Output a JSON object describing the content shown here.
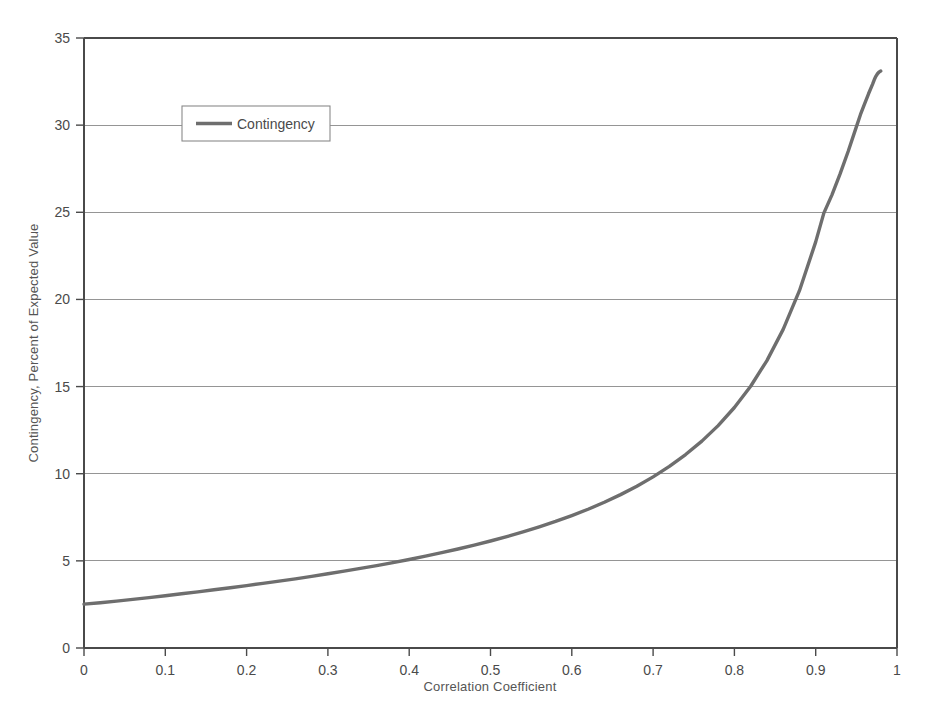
{
  "chart_data": {
    "type": "line",
    "title": "",
    "xlabel": "Correlation Coefficient",
    "ylabel": "Contingency, Percent of Expected Value",
    "xlim": [
      0,
      1
    ],
    "ylim": [
      0,
      35
    ],
    "xticks": [
      "0",
      "0.1",
      "0.2",
      "0.3",
      "0.4",
      "0.5",
      "0.6",
      "0.7",
      "0.8",
      "0.9",
      "1"
    ],
    "xtick_values": [
      0,
      0.1,
      0.2,
      0.3,
      0.4,
      0.5,
      0.6,
      0.7,
      0.8,
      0.9,
      1
    ],
    "yticks": [
      "0",
      "5",
      "10",
      "15",
      "20",
      "25",
      "30",
      "35"
    ],
    "ytick_values": [
      0,
      5,
      10,
      15,
      20,
      25,
      30,
      35
    ],
    "grid": "horizontal",
    "legend_position": "top-left-inside",
    "line_color": "#6e6e6e",
    "series": [
      {
        "name": "Contingency",
        "color": "#6e6e6e",
        "x": [
          0,
          0.02,
          0.04,
          0.06,
          0.08,
          0.1,
          0.12,
          0.14,
          0.16,
          0.18,
          0.2,
          0.22,
          0.24,
          0.26,
          0.28,
          0.3,
          0.32,
          0.34,
          0.36,
          0.38,
          0.4,
          0.42,
          0.44,
          0.46,
          0.48,
          0.5,
          0.52,
          0.54,
          0.56,
          0.58,
          0.6,
          0.62,
          0.64,
          0.66,
          0.68,
          0.7,
          0.72,
          0.74,
          0.76,
          0.78,
          0.8,
          0.82,
          0.84,
          0.86,
          0.88,
          0.9,
          0.91,
          0.92,
          0.93,
          0.94,
          0.95,
          0.955,
          0.96,
          0.965,
          0.97,
          0.972,
          0.974,
          0.976,
          0.978,
          0.98
        ],
        "y": [
          2.52,
          2.6,
          2.69,
          2.79,
          2.89,
          3.0,
          3.11,
          3.22,
          3.34,
          3.46,
          3.58,
          3.71,
          3.84,
          3.97,
          4.11,
          4.26,
          4.41,
          4.57,
          4.73,
          4.9,
          5.08,
          5.27,
          5.47,
          5.68,
          5.9,
          6.14,
          6.39,
          6.66,
          6.95,
          7.26,
          7.6,
          7.96,
          8.36,
          8.8,
          9.28,
          9.82,
          10.42,
          11.1,
          11.87,
          12.76,
          13.8,
          15.02,
          16.49,
          18.28,
          20.5,
          23.3,
          24.95,
          26.0,
          27.2,
          28.5,
          29.9,
          30.6,
          31.2,
          31.8,
          32.35,
          32.6,
          32.8,
          32.95,
          33.05,
          33.1
        ]
      }
    ]
  },
  "legend": {
    "entries": [
      {
        "label": "Contingency",
        "color": "#6e6e6e"
      }
    ]
  },
  "caption": {
    "text": ""
  }
}
